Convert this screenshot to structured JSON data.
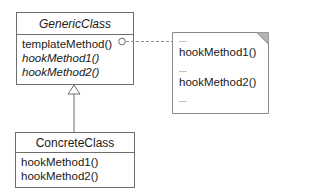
{
  "diagram": {
    "type": "UML class diagram (Template Method pattern)",
    "generic_class": {
      "name": "GenericClass",
      "name_style": "italic (abstract)",
      "operations": [
        {
          "label": "templateMethod()",
          "style": "normal"
        },
        {
          "label": "hookMethod1()",
          "style": "italic"
        },
        {
          "label": "hookMethod2()",
          "style": "italic"
        }
      ]
    },
    "concrete_class": {
      "name": "ConcreteClass",
      "operations": [
        {
          "label": "hookMethod1()"
        },
        {
          "label": "hookMethod2()"
        }
      ]
    },
    "note": {
      "lines": [
        "...",
        "hookMethod1()",
        "...",
        "hookMethod2()",
        "..."
      ]
    },
    "relationships": [
      {
        "type": "generalization",
        "from": "ConcreteClass",
        "to": "GenericClass"
      },
      {
        "type": "note-attachment",
        "from": "templateMethod()",
        "to": "note",
        "style": "dashed"
      }
    ],
    "colors": {
      "line": "#6e6e6e",
      "note_fold": "#b4b4b4",
      "text": "#1a1a1a",
      "background": "#ffffff"
    }
  }
}
